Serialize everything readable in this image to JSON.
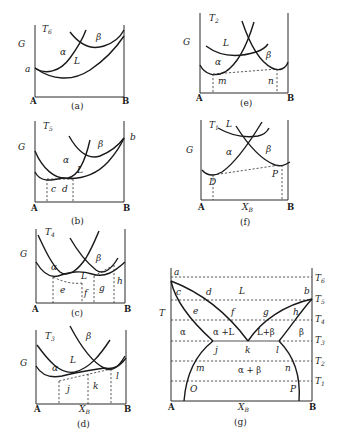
{
  "figure": {
    "phases": [
      "α",
      "β",
      "L"
    ],
    "components": [
      "A",
      "B"
    ],
    "x_axis_label": "X_B",
    "g_axis_label": "G",
    "t_axis_label": "T"
  },
  "panels": {
    "a": {
      "caption": "(a)",
      "temp": "T",
      "temp_sub": "6",
      "g": "G",
      "curve_labels": {
        "alpha": "α",
        "beta": "β",
        "liquid": "L"
      },
      "points": {
        "a": "a"
      },
      "left": "A",
      "right": "B"
    },
    "b": {
      "caption": "(b)",
      "temp": "T",
      "temp_sub": "5",
      "g": "G",
      "curve_labels": {
        "alpha": "α",
        "beta": "β",
        "liquid": "L"
      },
      "points": {
        "b": "b",
        "c": "c",
        "d": "d"
      },
      "left": "A",
      "right": "B"
    },
    "c": {
      "caption": "(c)",
      "temp": "T",
      "temp_sub": "4",
      "g": "G",
      "curve_labels": {
        "alpha": "α",
        "beta": "β",
        "liquid": "L"
      },
      "points": {
        "e": "e",
        "f": "f",
        "g": "g",
        "h": "h"
      },
      "left": "A",
      "right": "B"
    },
    "d": {
      "caption": "(d)",
      "temp": "T",
      "temp_sub": "3",
      "g": "G",
      "curve_labels": {
        "alpha": "α",
        "beta": "β",
        "liquid": "L"
      },
      "points": {
        "j": "j",
        "k": "k",
        "l": "l"
      },
      "left": "A",
      "right": "B",
      "x": "X",
      "x_sub": "B"
    },
    "e": {
      "caption": "(e)",
      "temp": "T",
      "temp_sub": "2",
      "g": "G",
      "curve_labels": {
        "alpha": "α",
        "beta": "β",
        "liquid": "L"
      },
      "points": {
        "m": "m",
        "n": "n"
      },
      "left": "A",
      "right": "B"
    },
    "f": {
      "caption": "(f)",
      "temp": "T",
      "temp_sub": "1",
      "g": "G",
      "curve_labels": {
        "alpha": "α",
        "beta": "β",
        "liquid": "L"
      },
      "points": {
        "D": "D",
        "P": "P"
      },
      "left": "A",
      "right": "B",
      "x": "X",
      "x_sub": "B"
    },
    "g": {
      "caption": "(g)",
      "t": "T",
      "left": "A",
      "right": "B",
      "x": "X",
      "x_sub": "B",
      "isotherms": [
        {
          "label": "T",
          "sub": "6"
        },
        {
          "label": "T",
          "sub": "5"
        },
        {
          "label": "T",
          "sub": "4"
        },
        {
          "label": "T",
          "sub": "3"
        },
        {
          "label": "T",
          "sub": "2"
        },
        {
          "label": "T",
          "sub": "1"
        }
      ],
      "regions": {
        "liquid": "L",
        "alpha": "α",
        "alpha_liquid": "α +L",
        "liquid_beta": "L+β",
        "beta": "β",
        "alpha_beta": "α + β"
      },
      "points": {
        "a": "a",
        "b": "b",
        "c": "c",
        "d": "d",
        "e": "e",
        "f": "f",
        "g": "g",
        "h": "h",
        "j": "j",
        "k": "k",
        "l": "l",
        "m": "m",
        "n": "n",
        "O": "O",
        "P": "P"
      }
    }
  }
}
